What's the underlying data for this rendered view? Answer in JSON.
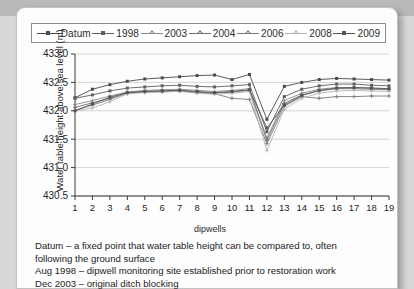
{
  "chart_data": {
    "type": "line",
    "title": "",
    "xlabel": "dipwells",
    "ylabel": "Water table height above sea level (m)",
    "x": [
      1,
      2,
      3,
      4,
      5,
      6,
      7,
      8,
      9,
      10,
      11,
      12,
      13,
      14,
      15,
      16,
      17,
      18,
      19
    ],
    "xticklabels": [
      "1",
      "2",
      "3",
      "4",
      "5",
      "6",
      "7",
      "8",
      "9",
      "10",
      "11",
      "12",
      "13",
      "14",
      "15",
      "16",
      "17",
      "18",
      "19"
    ],
    "yticklabels": [
      "430.5",
      "431.0",
      "431.5",
      "432.0",
      "432.5",
      "433.0"
    ],
    "yticks": [
      430.5,
      431.0,
      431.5,
      432.0,
      432.5,
      433.0
    ],
    "ylim": [
      430.5,
      433.0
    ],
    "xlim": [
      1,
      19
    ],
    "grid": "horizontal",
    "legend_position": "above-plot",
    "series": [
      {
        "name": "Datum",
        "color": "#4a4a4a",
        "marker": "square",
        "values": [
          432.23,
          432.38,
          432.46,
          432.52,
          432.56,
          432.58,
          432.6,
          432.62,
          432.63,
          432.55,
          432.64,
          431.85,
          432.43,
          432.5,
          432.55,
          432.57,
          432.56,
          432.55,
          432.54
        ]
      },
      {
        "name": "1998",
        "color": "#5f5f5f",
        "marker": "square",
        "values": [
          432.22,
          432.28,
          432.35,
          432.4,
          432.42,
          432.44,
          432.45,
          432.43,
          432.42,
          432.44,
          432.46,
          431.63,
          432.25,
          432.38,
          432.44,
          432.47,
          432.47,
          432.45,
          432.44
        ]
      },
      {
        "name": "2003",
        "color": "#8c8c8c",
        "marker": "plus",
        "values": [
          432.11,
          432.18,
          432.26,
          432.33,
          432.36,
          432.37,
          432.38,
          432.36,
          432.34,
          432.36,
          432.39,
          431.52,
          432.18,
          432.31,
          432.38,
          432.41,
          432.41,
          432.4,
          432.39
        ]
      },
      {
        "name": "2004",
        "color": "#6f6f6f",
        "marker": "plus",
        "values": [
          432.06,
          432.14,
          432.22,
          432.32,
          432.34,
          432.35,
          432.36,
          432.33,
          432.31,
          432.33,
          432.36,
          431.48,
          432.13,
          432.28,
          432.35,
          432.39,
          432.39,
          432.38,
          432.37
        ]
      },
      {
        "name": "2006",
        "color": "#7a7a7a",
        "marker": "plus",
        "values": [
          432.01,
          432.1,
          432.2,
          432.31,
          432.33,
          432.34,
          432.35,
          432.32,
          432.3,
          432.22,
          432.2,
          431.42,
          432.08,
          432.25,
          432.22,
          432.25,
          432.25,
          432.26,
          432.26
        ]
      },
      {
        "name": "2008",
        "color": "#b4b4b4",
        "marker": "plus",
        "values": [
          432.0,
          432.05,
          432.16,
          432.3,
          432.32,
          432.33,
          432.34,
          432.31,
          432.29,
          432.31,
          432.34,
          431.3,
          432.03,
          432.22,
          432.31,
          432.35,
          432.36,
          432.35,
          432.34
        ]
      },
      {
        "name": "2009",
        "color": "#555555",
        "marker": "square",
        "values": [
          432.0,
          432.12,
          432.24,
          432.32,
          432.34,
          432.35,
          432.36,
          432.34,
          432.32,
          432.34,
          432.37,
          431.7,
          432.1,
          432.27,
          432.36,
          432.4,
          432.41,
          432.4,
          432.39
        ]
      }
    ]
  },
  "legend": {
    "items": [
      {
        "label": "Datum"
      },
      {
        "label": "1998"
      },
      {
        "label": "2003"
      },
      {
        "label": "2004"
      },
      {
        "label": "2006"
      },
      {
        "label": "2008"
      },
      {
        "label": "2009"
      }
    ]
  },
  "caption": {
    "line1a": "Datum – a fixed point that water table height can be compared to, often",
    "line1b": "following the ground surface",
    "line2": "Aug 1998 – dipwell monitoring site established prior to restoration work",
    "line3": "Dec 2003 – original ditch blocking"
  }
}
